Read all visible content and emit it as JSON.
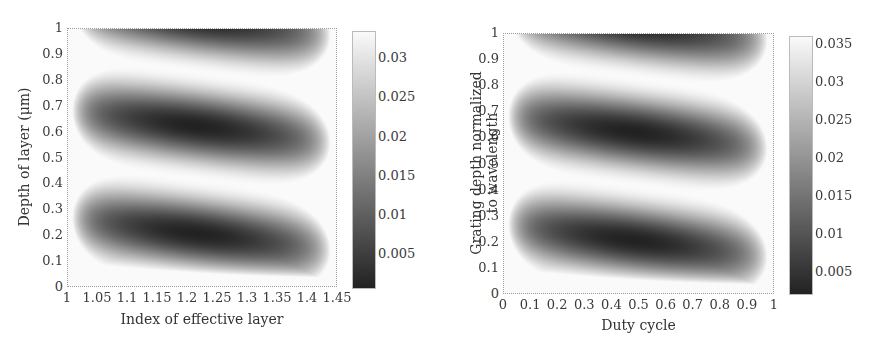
{
  "chart_data": [
    {
      "type": "heatmap",
      "title": "",
      "xlabel": "Index of effective layer",
      "ylabel": "Depth of layer (μm)",
      "xlim": [
        1,
        1.45
      ],
      "ylim": [
        0,
        1
      ],
      "xticks": [
        "1",
        "1.05",
        "1.1",
        "1.15",
        "1.2",
        "1.25",
        "1.3",
        "1.35",
        "1.4",
        "1.45"
      ],
      "yticks": [
        "0",
        "0.1",
        "0.2",
        "0.3",
        "0.4",
        "0.5",
        "0.6",
        "0.7",
        "0.8",
        "0.9",
        "1"
      ],
      "colorbar": {
        "ticks": [
          "0.005",
          "0.01",
          "0.015",
          "0.02",
          "0.025",
          "0.03"
        ],
        "range": [
          0.0005,
          0.0335
        ],
        "colormap": "gray"
      },
      "features": {
        "dark_minima": [
          {
            "x": 1.21,
            "y": 0.2,
            "value": 0.001
          },
          {
            "x": 1.2,
            "y": 0.62,
            "value": 0.001
          },
          {
            "x": 1.25,
            "y": 0.98,
            "value": 0.003
          }
        ],
        "bright_bands_y_at_left_to_right": [
          [
            0.47,
            0.37
          ],
          [
            0.88,
            0.75
          ]
        ]
      }
    },
    {
      "type": "heatmap",
      "title": "",
      "xlabel": "Duty cycle",
      "ylabel": "Grating depth normalized to wavelength",
      "xlim": [
        0,
        1
      ],
      "ylim": [
        0,
        1
      ],
      "xticks": [
        "0",
        "0.1",
        "0.2",
        "0.3",
        "0.4",
        "0.5",
        "0.6",
        "0.7",
        "0.8",
        "0.9",
        "1"
      ],
      "yticks": [
        "0",
        "0.1",
        "0.2",
        "0.3",
        "0.4",
        "0.5",
        "0.6",
        "0.7",
        "0.8",
        "0.9",
        "1"
      ],
      "colorbar": {
        "ticks": [
          "0.005",
          "0.01",
          "0.015",
          "0.02",
          "0.025",
          "0.03",
          "0.035"
        ],
        "range": [
          0.002,
          0.036
        ],
        "colormap": "gray"
      },
      "features": {
        "dark_minima": [
          {
            "x": 0.45,
            "y": 0.2,
            "value": 0.002
          },
          {
            "x": 0.5,
            "y": 0.6,
            "value": 0.002
          },
          {
            "x": 0.55,
            "y": 0.98,
            "value": 0.004
          }
        ],
        "bright_bands_y_at_left_to_right": [
          [
            0.48,
            0.38
          ],
          [
            0.9,
            0.76
          ]
        ]
      }
    }
  ],
  "left": {
    "xlabel": "Index of effective layer",
    "ylabel": "Depth of layer (μm)"
  },
  "right": {
    "xlabel": "Duty cycle",
    "ylabel_line1": "Grating depth normalized",
    "ylabel_line2": "to wavelength"
  }
}
